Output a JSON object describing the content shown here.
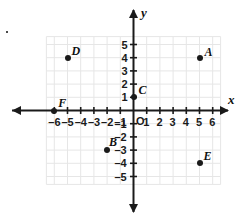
{
  "chart_data": {
    "type": "scatter",
    "title": "",
    "xlabel": "x",
    "ylabel": "y",
    "xlim": [
      -6.8,
      6.8
    ],
    "ylim": [
      -5.8,
      5.8
    ],
    "grid": true,
    "legend": "none",
    "origin_label": "O",
    "x_ticks": [
      -6,
      -5,
      -4,
      -3,
      -2,
      -1,
      1,
      2,
      3,
      4,
      5,
      6
    ],
    "y_ticks": [
      -5,
      -4,
      -3,
      -2,
      -1,
      1,
      2,
      3,
      4,
      5
    ],
    "x_tick_labels": [
      "–6",
      "–5",
      "–4",
      "–3",
      "–2",
      "–1",
      "1",
      "2",
      "3",
      "4",
      "5",
      "6"
    ],
    "y_tick_labels": [
      "–5",
      "–4",
      "–3",
      "–2",
      "–1",
      "1",
      "2",
      "3",
      "4",
      "5"
    ],
    "points": [
      {
        "label": "A",
        "x": 5,
        "y": 4,
        "label_dx": 5,
        "label_dy": -12
      },
      {
        "label": "B",
        "x": -2,
        "y": -3,
        "label_dx": 2,
        "label_dy": -14
      },
      {
        "label": "C",
        "x": 0,
        "y": 1,
        "label_dx": 5,
        "label_dy": -13
      },
      {
        "label": "D",
        "x": -5,
        "y": 4,
        "label_dx": 4,
        "label_dy": -13
      },
      {
        "label": "E",
        "x": 5,
        "y": -4,
        "label_dx": 4,
        "label_dy": -13
      },
      {
        "label": "F",
        "x": -6,
        "y": 0,
        "label_dx": 4,
        "label_dy": -14
      }
    ]
  },
  "axes": {
    "x_axis_name": "x",
    "y_axis_name": "y"
  },
  "colors": {
    "grid": "#e6e6e6",
    "axis": "#1a1a1a",
    "point": "#1a1a1a",
    "text": "#111111",
    "background": "#ffffff"
  }
}
